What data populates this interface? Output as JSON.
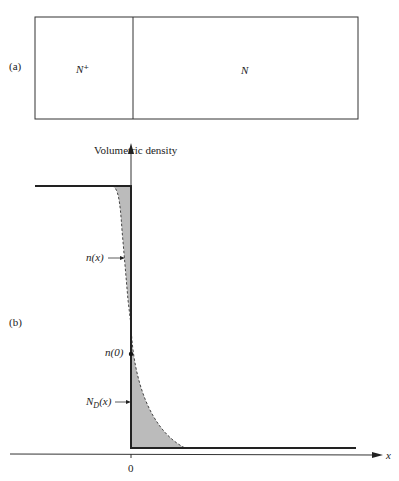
{
  "panel_a": {
    "label": "(a)",
    "regions": [
      {
        "label": "N⁺"
      },
      {
        "label": "N"
      }
    ]
  },
  "panel_b": {
    "label": "(b)",
    "y_axis_label": "Volumetric density",
    "x_axis_label": "x",
    "x_tick": "0",
    "annotations": {
      "n_x": "n(x)",
      "n_0": "n(0)",
      "nd_x_main": "N",
      "nd_x_sub": "D",
      "nd_x_tail": "(x)"
    }
  }
}
